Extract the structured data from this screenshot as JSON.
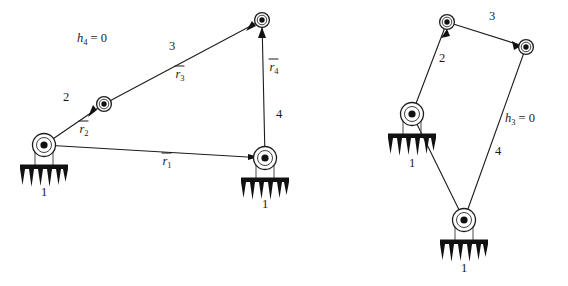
{
  "figure": {
    "domain": "diagram",
    "background_color": "#ffffff",
    "ink_color": "#1a1a1a",
    "ground_color": "#111111"
  },
  "diagrams": [
    {
      "id": "left-linkage",
      "name": "four-bar-linkage-left",
      "condition_label": {
        "text": "h4 = 0",
        "base": "h",
        "subscript": "4",
        "equals": "= 0",
        "x": 92,
        "y": 42
      },
      "joints": [
        {
          "name": "ground-pivot-left",
          "kind": "ground",
          "x": 44,
          "y": 145,
          "label": "1",
          "label_x": 44,
          "label_y": 196
        },
        {
          "name": "moving-joint-a",
          "kind": "pin",
          "x": 104,
          "y": 104,
          "label": ""
        },
        {
          "name": "moving-joint-b",
          "kind": "pin",
          "x": 262,
          "y": 20,
          "label": ""
        },
        {
          "name": "ground-pivot-right",
          "kind": "ground",
          "x": 265,
          "y": 158,
          "label": "1",
          "label_x": 265,
          "label_y": 208
        }
      ],
      "links": [
        {
          "name": "link-2",
          "number": "2",
          "from": "ground-pivot-left",
          "to": "moving-joint-a",
          "number_x": 66,
          "number_y": 101
        },
        {
          "name": "link-3",
          "number": "3",
          "from": "moving-joint-a",
          "to": "moving-joint-b",
          "number_x": 172,
          "number_y": 50
        },
        {
          "name": "link-4",
          "number": "4",
          "from": "moving-joint-b",
          "to": "ground-pivot-right",
          "number_x": 279,
          "number_y": 118
        },
        {
          "name": "link-1-ground",
          "number": "",
          "from": "ground-pivot-left",
          "to": "ground-pivot-right",
          "number_x": 0,
          "number_y": 0
        }
      ],
      "vectors": [
        {
          "name": "vector-r1",
          "base": "r",
          "subscript": "1",
          "x": 167,
          "y": 163,
          "overbar": true
        },
        {
          "name": "vector-r2",
          "base": "r",
          "subscript": "2",
          "x": 84,
          "y": 133,
          "overbar": true
        },
        {
          "name": "vector-r3",
          "base": "r",
          "subscript": "3",
          "x": 180,
          "y": 78,
          "overbar": true
        },
        {
          "name": "vector-r4",
          "base": "r",
          "subscript": "4",
          "x": 274,
          "y": 71,
          "overbar": true
        }
      ]
    },
    {
      "id": "right-linkage",
      "name": "four-bar-linkage-right",
      "condition_label": {
        "text": "h3 = 0",
        "base": "h",
        "subscript": "3",
        "equals": "= 0",
        "x": 520,
        "y": 122
      },
      "joints": [
        {
          "name": "ground-pivot-upper",
          "kind": "ground",
          "x": 412,
          "y": 114,
          "label": "1",
          "label_x": 412,
          "label_y": 167
        },
        {
          "name": "moving-joint-top",
          "kind": "pin",
          "x": 447,
          "y": 22,
          "label": ""
        },
        {
          "name": "moving-joint-right",
          "kind": "pin",
          "x": 526,
          "y": 47,
          "label": ""
        },
        {
          "name": "ground-pivot-lower",
          "kind": "ground",
          "x": 464,
          "y": 220,
          "label": "1",
          "label_x": 464,
          "label_y": 272
        }
      ],
      "links": [
        {
          "name": "link-2",
          "number": "2",
          "from": "ground-pivot-upper",
          "to": "moving-joint-top",
          "number_x": 442,
          "number_y": 62
        },
        {
          "name": "link-3",
          "number": "3",
          "from": "moving-joint-top",
          "to": "moving-joint-right",
          "number_x": 492,
          "number_y": 20
        },
        {
          "name": "link-4",
          "number": "4",
          "from": "moving-joint-right",
          "to": "ground-pivot-lower",
          "number_x": 498,
          "number_y": 155
        },
        {
          "name": "link-1-ground",
          "number": "",
          "from": "ground-pivot-upper",
          "to": "ground-pivot-lower",
          "number_x": 0,
          "number_y": 0
        }
      ],
      "vectors": []
    }
  ]
}
